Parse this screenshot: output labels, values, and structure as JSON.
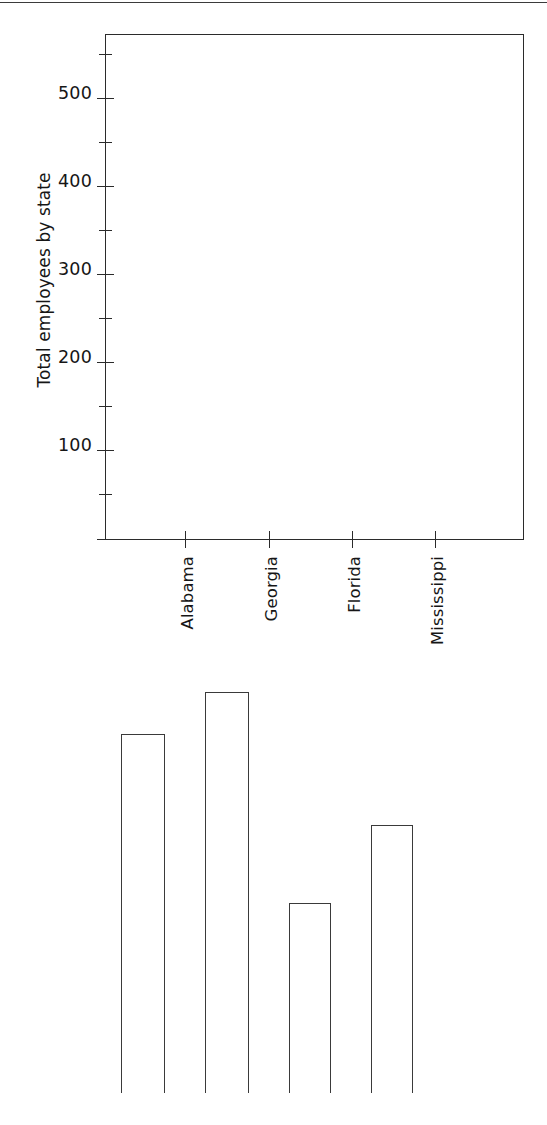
{
  "figure": {
    "kind": "bar-chart-figure",
    "background_color": "#ffffff",
    "ink_color": "#2b2b2b",
    "page_rule_name": "top-page-rule"
  },
  "axis_title_y": "Total employees by state",
  "y_axis": {
    "major_ticks": [
      100,
      200,
      300,
      400,
      500
    ],
    "major_tick_labels": [
      "100",
      "200",
      "300",
      "400",
      "500"
    ],
    "minor_ticks": [
      50,
      150,
      250,
      350,
      450,
      550
    ],
    "range": [
      0,
      575
    ]
  },
  "x_axis": {
    "tick_labels": [
      "Alabama",
      "Georgia",
      "Florida",
      "Mississippi"
    ],
    "label_rotation": "90"
  },
  "chart_data": {
    "type": "bar",
    "title": "",
    "xlabel": "",
    "ylabel": "Total employees by state",
    "categories": [
      "Alabama",
      "Georgia",
      "Florida",
      "Mississippi"
    ],
    "values": [
      408,
      456,
      216,
      305
    ],
    "ylim": [
      0,
      575
    ],
    "yticks": [
      100,
      200,
      300,
      400,
      500
    ],
    "ytick_labels": [
      "100",
      "200",
      "300",
      "400",
      "500"
    ],
    "minor_yticks": [
      50,
      150,
      250,
      350,
      450,
      550
    ],
    "grid": false,
    "legend": false,
    "bar_fill": "none",
    "bar_edge_color": "#3a3a3a",
    "note": "Bars are rendered in a detached lower panel, offset below and left of the plotted axes frame (scan/layout artifact of the source figure)."
  },
  "bar_geometry": {
    "baseline_y": 1093,
    "bars": [
      {
        "category": "Alabama",
        "left": 121,
        "width": 44,
        "top": 734,
        "value": 408
      },
      {
        "category": "Georgia",
        "left": 205,
        "width": 44,
        "top": 692,
        "value": 456
      },
      {
        "category": "Florida",
        "left": 289,
        "width": 42,
        "top": 903,
        "value": 216
      },
      {
        "category": "Mississippi",
        "left": 371,
        "width": 42,
        "top": 825,
        "value": 305
      }
    ]
  },
  "tick_geometry": {
    "y_zero_px": 538,
    "px_per_unit": 0.88,
    "x_tick_px": [
      185,
      269,
      352,
      435
    ]
  }
}
